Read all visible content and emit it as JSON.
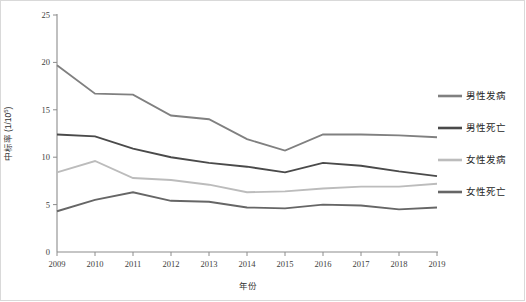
{
  "chart_data": {
    "type": "line",
    "title": "",
    "xlabel": "年份",
    "ylabel": "中标率 (1/10⁵)",
    "ylabel_main": "中标率 (1/10",
    "ylabel_sup": "5",
    "ylabel_tail": ")",
    "x": [
      "2009",
      "2010",
      "2011",
      "2012",
      "2013",
      "2014",
      "2015",
      "2016",
      "2017",
      "2018",
      "2019"
    ],
    "categories": [
      "2009",
      "2010",
      "2011",
      "2012",
      "2013",
      "2014",
      "2015",
      "2016",
      "2017",
      "2018",
      "2019"
    ],
    "xlim": [
      2009,
      2019
    ],
    "ylim": [
      0,
      25
    ],
    "yticks": [
      0,
      5,
      10,
      15,
      20,
      25
    ],
    "ytick_labels": [
      "0",
      "5",
      "10",
      "15",
      "20",
      "25"
    ],
    "grid": false,
    "legend_position": "right",
    "series": [
      {
        "name": "男性发病",
        "color": "#808080",
        "values": [
          19.7,
          16.7,
          16.6,
          14.4,
          14.0,
          11.9,
          10.7,
          12.4,
          12.4,
          12.3,
          12.1
        ]
      },
      {
        "name": "男性死亡",
        "color": "#4a4a4a",
        "values": [
          12.4,
          12.2,
          10.9,
          10.0,
          9.4,
          9.0,
          8.4,
          9.4,
          9.1,
          8.5,
          8.0
        ]
      },
      {
        "name": "女性发病",
        "color": "#bcbcbc",
        "values": [
          8.4,
          9.6,
          7.8,
          7.6,
          7.1,
          6.3,
          6.4,
          6.7,
          6.9,
          6.9,
          7.2
        ]
      },
      {
        "name": "女性死亡",
        "color": "#666666",
        "values": [
          4.3,
          5.5,
          6.3,
          5.4,
          5.3,
          4.7,
          4.6,
          5.0,
          4.9,
          4.5,
          4.7
        ]
      }
    ]
  },
  "legend": {
    "items": [
      {
        "label": "男性发病",
        "color": "#808080"
      },
      {
        "label": "男性死亡",
        "color": "#4a4a4a"
      },
      {
        "label": "女性发病",
        "color": "#bcbcbc"
      },
      {
        "label": "女性死亡",
        "color": "#666666"
      }
    ]
  }
}
